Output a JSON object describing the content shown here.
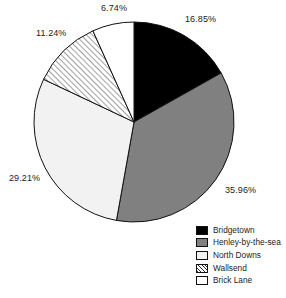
{
  "chart_data": {
    "type": "pie",
    "title": "",
    "labels": [
      "Bridgetown",
      "Henley-by-the-sea",
      "North Downs",
      "Wallsend",
      "Brick Lane"
    ],
    "values": [
      16.85,
      35.96,
      29.21,
      11.24,
      6.74
    ],
    "value_labels": [
      "16.85%",
      "35.96%",
      "29.21%",
      "11.24%",
      "6.74%"
    ],
    "units": "percent",
    "total": 100.0,
    "start_angle_deg": 0,
    "direction": "clockwise",
    "legend_position": "bottom-right",
    "grid": false,
    "slices": [
      {
        "label": "Bridgetown",
        "value": 16.85,
        "value_label": "16.85%",
        "fill": "#000000",
        "pattern": "solid",
        "label_x": 185,
        "label_y": 14
      },
      {
        "label": "Henley-by-the-sea",
        "value": 35.96,
        "value_label": "35.96%",
        "fill": "#808080",
        "pattern": "solid",
        "label_x": 225,
        "label_y": 185
      },
      {
        "label": "North Downs",
        "value": 29.21,
        "value_label": "29.21%",
        "fill": "#f2f2f2",
        "pattern": "solid",
        "label_x": 9,
        "label_y": 173
      },
      {
        "label": "Wallsend",
        "value": 11.24,
        "value_label": "11.24%",
        "fill": "#ffffff",
        "pattern": "diagonal-hatch",
        "label_x": 36,
        "label_y": 28
      },
      {
        "label": "Brick Lane",
        "value": 6.74,
        "value_label": "6.74%",
        "fill": "#ffffff",
        "pattern": "solid",
        "label_x": 101,
        "label_y": 3
      }
    ],
    "geometry": {
      "center_x": 134,
      "center_y": 122,
      "radius": 100
    },
    "colors": {
      "outline": "#111111",
      "black": "#000000",
      "gray": "#808080",
      "light_gray": "#f2f2f2",
      "white": "#ffffff",
      "text": "#1c1c1c"
    }
  },
  "legend": {
    "items": [
      {
        "label": "Bridgetown",
        "swatch": "black"
      },
      {
        "label": "Henley-by-the-sea",
        "swatch": "gray"
      },
      {
        "label": "North Downs",
        "swatch": "light-gray"
      },
      {
        "label": "Wallsend",
        "swatch": "hatch"
      },
      {
        "label": "Brick Lane",
        "swatch": "white"
      }
    ]
  }
}
